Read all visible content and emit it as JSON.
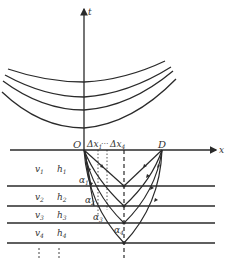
{
  "diagram": {
    "axes": {
      "t_label": "t",
      "x_label": "x",
      "origin_label": "O",
      "receiver_label": "D"
    },
    "offset_labels": {
      "first": "Δx",
      "first_sub": "1",
      "ellipsis": "···",
      "last": "Δx",
      "last_sub": "4"
    },
    "layers": [
      {
        "velocity": "v",
        "velocity_sub": "1",
        "thickness": "h",
        "thickness_sub": "1",
        "angle": "α",
        "angle_sub": "1"
      },
      {
        "velocity": "v",
        "velocity_sub": "2",
        "thickness": "h",
        "thickness_sub": "2",
        "angle": "α",
        "angle_sub": "2"
      },
      {
        "velocity": "v",
        "velocity_sub": "3",
        "thickness": "h",
        "thickness_sub": "3",
        "angle": "α",
        "angle_sub": "3"
      },
      {
        "velocity": "v",
        "velocity_sub": "4",
        "thickness": "h",
        "thickness_sub": "4",
        "angle": "α",
        "angle_sub": "4"
      }
    ],
    "continuation": "⋮",
    "colors": {
      "line": "#2a2a2a",
      "text": "#333333",
      "background": "#ffffff"
    }
  }
}
